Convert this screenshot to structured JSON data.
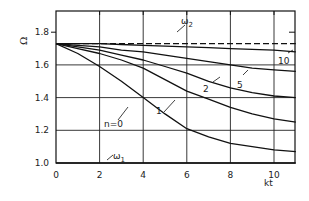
{
  "chart_data": {
    "type": "line",
    "title": "",
    "xlabel": "kt",
    "ylabel": "Ω",
    "xlim": [
      0,
      11
    ],
    "ylim": [
      1.0,
      1.9
    ],
    "grid": true,
    "x_ticks": [
      0,
      2,
      4,
      6,
      8,
      10
    ],
    "x_tick_labels": [
      "0",
      "2",
      "4",
      "6",
      "8",
      "10"
    ],
    "y_ticks": [
      1.0,
      1.2,
      1.4,
      1.6,
      1.8
    ],
    "y_tick_labels": [
      "1.0",
      "1.2",
      "1.4",
      "1.6",
      "1.8"
    ],
    "x": [
      0,
      1,
      2,
      3,
      4,
      5,
      6,
      7,
      8,
      9,
      10,
      11
    ],
    "series": [
      {
        "name": "ω2",
        "label": "ω",
        "subscript": "2",
        "style": "dashed",
        "values": [
          1.73,
          1.73,
          1.73,
          1.73,
          1.73,
          1.73,
          1.73,
          1.73,
          1.73,
          1.73,
          1.73,
          1.73
        ]
      },
      {
        "name": "n=10",
        "label": "10",
        "style": "solid",
        "values": [
          1.73,
          1.73,
          1.73,
          1.725,
          1.72,
          1.715,
          1.71,
          1.705,
          1.7,
          1.695,
          1.69,
          1.68
        ]
      },
      {
        "name": "n=5",
        "label": "5",
        "style": "solid",
        "values": [
          1.73,
          1.72,
          1.71,
          1.69,
          1.68,
          1.66,
          1.64,
          1.62,
          1.6,
          1.58,
          1.57,
          1.56
        ]
      },
      {
        "name": "n=2",
        "label": "2",
        "style": "solid",
        "values": [
          1.73,
          1.71,
          1.69,
          1.66,
          1.63,
          1.59,
          1.55,
          1.5,
          1.46,
          1.43,
          1.41,
          1.4
        ]
      },
      {
        "name": "n=1",
        "label": "1",
        "style": "solid",
        "values": [
          1.73,
          1.7,
          1.67,
          1.63,
          1.58,
          1.51,
          1.44,
          1.39,
          1.34,
          1.3,
          1.27,
          1.25
        ]
      },
      {
        "name": "n=0",
        "label": "n=0",
        "style": "solid",
        "values": [
          1.73,
          1.67,
          1.59,
          1.5,
          1.4,
          1.3,
          1.21,
          1.16,
          1.12,
          1.1,
          1.08,
          1.07
        ]
      },
      {
        "name": "ω1",
        "label": "ω",
        "subscript": "1",
        "style": "solid",
        "values": [
          1.0,
          1.0,
          1.0,
          1.0,
          1.0,
          1.0,
          1.0,
          1.0,
          1.0,
          1.0,
          1.0,
          1.0
        ]
      }
    ],
    "annotations": [
      {
        "text": "ω2",
        "x": 5.5,
        "y": 1.77
      },
      {
        "text": "10",
        "x": 10.3,
        "y": 1.66
      },
      {
        "text": "5",
        "x": 8.5,
        "y": 1.53
      },
      {
        "text": "2",
        "x": 5.7,
        "y": 1.45
      },
      {
        "text": "1",
        "x": 5.0,
        "y": 1.37
      },
      {
        "text": "n=0",
        "x": 3.0,
        "y": 1.32
      },
      {
        "text": "ω1",
        "x": 3.0,
        "y": 1.07
      }
    ],
    "legend": "none"
  }
}
